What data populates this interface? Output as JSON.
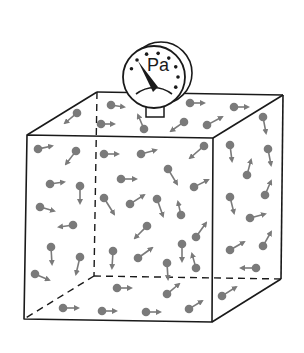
{
  "diagram": {
    "type": "gas-pressure-box",
    "gauge": {
      "unit_label": "Pa",
      "center": [
        154,
        77
      ],
      "radius": 31,
      "back_rim_center": [
        161,
        73
      ],
      "needle_angle_deg": -55,
      "tick_count": 8
    },
    "cube": {
      "front": {
        "tl": [
          27,
          135
        ],
        "tr": [
          213,
          138
        ],
        "br": [
          212,
          322
        ],
        "bl": [
          24,
          319
        ]
      },
      "back": {
        "tl": [
          97,
          92
        ],
        "tr": [
          283,
          95
        ],
        "br": [
          281,
          279
        ],
        "bl": [
          94,
          276
        ]
      }
    },
    "colors": {
      "line": "#1a1a1a",
      "particle": "#7a7a7a",
      "arrow": "#7a7a7a"
    },
    "particles": [
      {
        "x": 111,
        "y": 105,
        "dx": 13,
        "dy": 2
      },
      {
        "x": 190,
        "y": 103,
        "dx": 14,
        "dy": 0
      },
      {
        "x": 234,
        "y": 107,
        "dx": 14,
        "dy": 0
      },
      {
        "x": 101,
        "y": 124,
        "dx": 13,
        "dy": 0
      },
      {
        "x": 144,
        "y": 129,
        "dx": -6,
        "dy": -14
      },
      {
        "x": 184,
        "y": 122,
        "dx": -13,
        "dy": 9
      },
      {
        "x": 207,
        "y": 125,
        "dx": 15,
        "dy": -8
      },
      {
        "x": 263,
        "y": 117,
        "dx": 3,
        "dy": 16
      },
      {
        "x": 77,
        "y": 113,
        "dx": -12,
        "dy": 10
      },
      {
        "x": 38,
        "y": 149,
        "dx": 14,
        "dy": -3
      },
      {
        "x": 76,
        "y": 151,
        "dx": -10,
        "dy": 13
      },
      {
        "x": 104,
        "y": 154,
        "dx": 14,
        "dy": 0
      },
      {
        "x": 141,
        "y": 154,
        "dx": 15,
        "dy": -4
      },
      {
        "x": 204,
        "y": 146,
        "dx": -14,
        "dy": 12
      },
      {
        "x": 50,
        "y": 184,
        "dx": 14,
        "dy": -2
      },
      {
        "x": 80,
        "y": 186,
        "dx": 0,
        "dy": 17
      },
      {
        "x": 121,
        "y": 179,
        "dx": 15,
        "dy": 0
      },
      {
        "x": 168,
        "y": 169,
        "dx": 9,
        "dy": 15
      },
      {
        "x": 194,
        "y": 187,
        "dx": 14,
        "dy": -7
      },
      {
        "x": 40,
        "y": 207,
        "dx": 14,
        "dy": 4
      },
      {
        "x": 73,
        "y": 225,
        "dx": -14,
        "dy": 2
      },
      {
        "x": 104,
        "y": 198,
        "dx": 10,
        "dy": 16
      },
      {
        "x": 130,
        "y": 204,
        "dx": 14,
        "dy": -9
      },
      {
        "x": 157,
        "y": 199,
        "dx": 6,
        "dy": 17
      },
      {
        "x": 181,
        "y": 215,
        "dx": -3,
        "dy": -13
      },
      {
        "x": 147,
        "y": 226,
        "dx": -12,
        "dy": 12
      },
      {
        "x": 182,
        "y": 244,
        "dx": 0,
        "dy": 17
      },
      {
        "x": 196,
        "y": 237,
        "dx": 10,
        "dy": -14
      },
      {
        "x": 51,
        "y": 247,
        "dx": 1,
        "dy": 17
      },
      {
        "x": 80,
        "y": 257,
        "dx": -4,
        "dy": 17
      },
      {
        "x": 113,
        "y": 251,
        "dx": -1,
        "dy": 17
      },
      {
        "x": 138,
        "y": 258,
        "dx": 14,
        "dy": -10
      },
      {
        "x": 167,
        "y": 263,
        "dx": 1,
        "dy": 16
      },
      {
        "x": 196,
        "y": 268,
        "dx": -4,
        "dy": -14
      },
      {
        "x": 35,
        "y": 274,
        "dx": 14,
        "dy": 6
      },
      {
        "x": 117,
        "y": 288,
        "dx": 14,
        "dy": 0
      },
      {
        "x": 167,
        "y": 294,
        "dx": 12,
        "dy": -10
      },
      {
        "x": 63,
        "y": 308,
        "dx": 15,
        "dy": 0
      },
      {
        "x": 102,
        "y": 311,
        "dx": 14,
        "dy": 0
      },
      {
        "x": 146,
        "y": 312,
        "dx": 14,
        "dy": 0
      },
      {
        "x": 189,
        "y": 309,
        "dx": 13,
        "dy": -8
      },
      {
        "x": 230,
        "y": 145,
        "dx": 2,
        "dy": 16
      },
      {
        "x": 268,
        "y": 149,
        "dx": 3,
        "dy": 16
      },
      {
        "x": 247,
        "y": 175,
        "dx": 4,
        "dy": -15
      },
      {
        "x": 230,
        "y": 197,
        "dx": 4,
        "dy": 16
      },
      {
        "x": 265,
        "y": 195,
        "dx": 6,
        "dy": -14
      },
      {
        "x": 250,
        "y": 218,
        "dx": 15,
        "dy": -4
      },
      {
        "x": 230,
        "y": 250,
        "dx": 14,
        "dy": -8
      },
      {
        "x": 263,
        "y": 246,
        "dx": 8,
        "dy": -14
      },
      {
        "x": 256,
        "y": 268,
        "dx": -15,
        "dy": 0
      },
      {
        "x": 222,
        "y": 296,
        "dx": 14,
        "dy": -9
      }
    ]
  }
}
